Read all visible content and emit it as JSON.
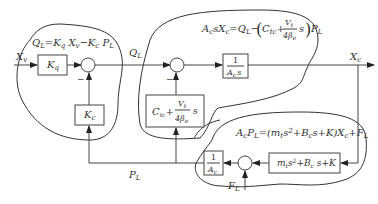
{
  "equations": {
    "flow": "Q_L = K_q X_v − K_c P_L",
    "flow_parts": {
      "a": "Q",
      "a_sub": "L",
      "eq": "=K",
      "b_sub": "q",
      "c": " X",
      "c_sub": "v",
      "d": "−K",
      "d_sub": "c",
      "e": " P",
      "e_sub": "L"
    },
    "continuity": "A_c s X_c = Q_L − (C_tc + V_t/(4β_e) s) P_L",
    "force": "A_c P_L = (m_t s² + B_c s + K) X_c + F_L"
  },
  "signals": {
    "input": "X",
    "input_sub": "v",
    "flow": "Q",
    "flow_sub": "L",
    "output": "X",
    "output_sub": "c",
    "pressure": "P",
    "pressure_sub": "L",
    "disturbance": "F",
    "disturbance_sub": "L"
  },
  "blocks": {
    "kq": {
      "label": "K",
      "sub": "q"
    },
    "kc": {
      "label": "K",
      "sub": "c"
    },
    "integrator": {
      "num": "1",
      "den": "A",
      "den_sub": "c",
      "den_tail": "s"
    },
    "leakage": {
      "a": "C",
      "a_sub": "tc",
      "plus": "+",
      "num": "V",
      "num_sub": "t",
      "den": "4β",
      "den_sub": "e",
      "tail": "s"
    },
    "area_inv": {
      "num": "1",
      "den": "A",
      "den_sub": "c"
    },
    "load": {
      "text": "m",
      "sub1": "t",
      "rest1": "s",
      "sup": "2",
      "rest2": "+B",
      "sub2": "c",
      "rest3": " s+K"
    }
  },
  "signs": {
    "minus": "−"
  }
}
